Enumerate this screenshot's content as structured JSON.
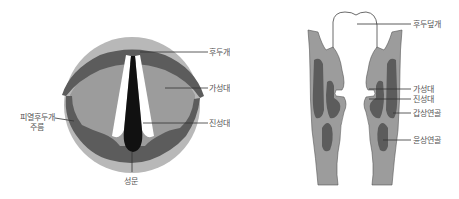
{
  "colors": {
    "outer_ring": "#b8b8b8",
    "mid_gray": "#9c9c9c",
    "dark_gray": "#5c5c5c",
    "glottis": "#111111",
    "vocal_strip": "#ffffff",
    "label_text": "#555555",
    "leader_line": "#333333"
  },
  "left_diagram": {
    "view": "superior view of larynx",
    "labels": {
      "epiglottis": "후두개",
      "false_vocal_fold": "가성대",
      "true_vocal_fold": "진성대",
      "aryepiglottic_fold_line1": "피열후두개",
      "aryepiglottic_fold_line2": "주름",
      "glottis": "성문"
    }
  },
  "right_diagram": {
    "view": "coronal section of larynx",
    "labels": {
      "epiglottis": "후두덮개",
      "false_vocal_fold": "가성대",
      "true_vocal_fold": "진성대",
      "thyroid_cartilage": "갑상연골",
      "cricoid_cartilage": "윤상연골"
    }
  }
}
